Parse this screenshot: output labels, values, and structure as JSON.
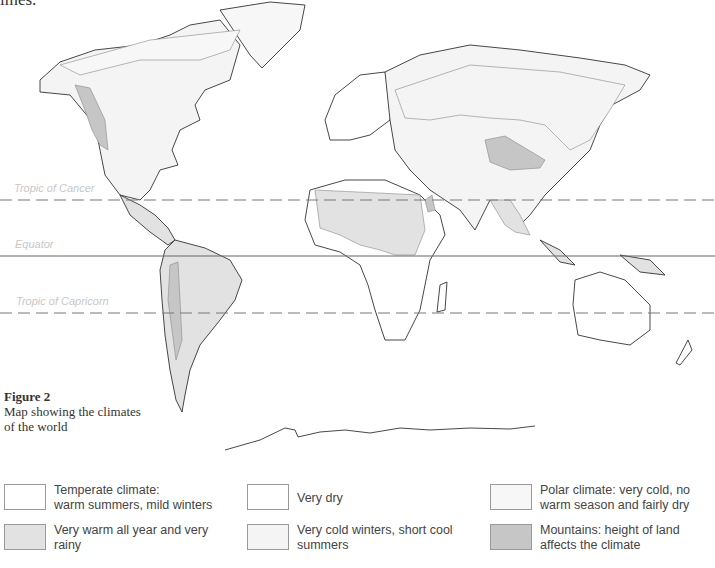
{
  "top_fragment": "imes.",
  "map": {
    "reference_lines": [
      {
        "name": "Tropic of Cancer",
        "y": 200,
        "style": "dashed"
      },
      {
        "name": "Equator",
        "y": 256,
        "style": "solid"
      },
      {
        "name": "Tropic of Capricorn",
        "y": 313,
        "style": "dashed"
      }
    ],
    "colors": {
      "temperate": "#ffffff",
      "very_warm_rainy": "#e2e2e2",
      "very_dry": "#ffffff",
      "very_cold_winters": "#f4f4f4",
      "polar": "#f7f7f7",
      "mountains": "#c6c6c6",
      "coast": "#333333",
      "boundary": "#888888"
    }
  },
  "labels": {
    "tropic_cancer": "Tropic of Cancer",
    "equator": "Equator",
    "tropic_capricorn": "Tropic of Capricorn"
  },
  "caption": {
    "title": "Figure 2",
    "line1": "Map showing the climates",
    "line2": "of the world"
  },
  "legend": {
    "items": [
      {
        "label_line1": "Temperate climate:",
        "label_line2": "warm summers, mild winters",
        "color": "#ffffff"
      },
      {
        "label_line1": "Very warm all year and very",
        "label_line2": "rainy",
        "color": "#e2e2e2"
      },
      {
        "label_line1": "Very dry",
        "label_line2": "",
        "color": "#ffffff"
      },
      {
        "label_line1": "Very cold winters, short cool",
        "label_line2": "summers",
        "color": "#f4f4f4"
      },
      {
        "label_line1": "Polar climate: very cold, no",
        "label_line2": "warm season and fairly dry",
        "color": "#f7f7f7"
      },
      {
        "label_line1": "Mountains: height of land",
        "label_line2": "affects the climate",
        "color": "#c6c6c6"
      }
    ]
  }
}
